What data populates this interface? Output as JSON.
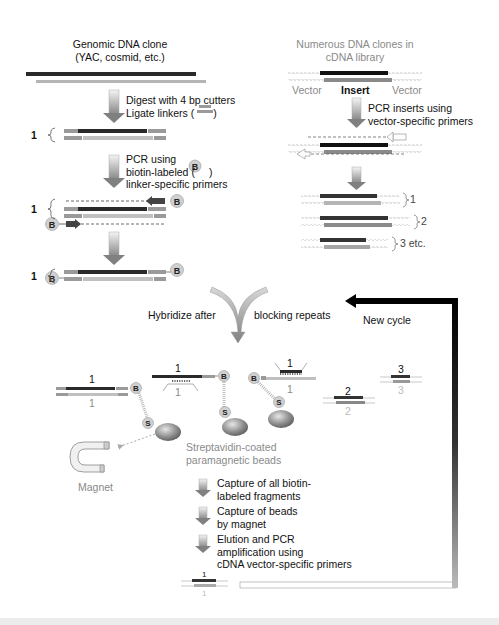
{
  "figure": {
    "left_panel": {
      "title_line1": "Genomic DNA clone",
      "title_line2": "(YAC, cosmid, etc.)",
      "step1_line1": "Digest with 4 bp cutters",
      "step1_line2": "Ligate linkers (",
      "step1_line2_end": ")",
      "step2_line1": "PCR using",
      "step2_line2": "biotin-labeled (",
      "step2_line2_end": ")",
      "step2_line3": "linker-specific primers",
      "fragment_label": "1"
    },
    "right_panel": {
      "title_line1": "Numerous DNA clones in",
      "title_line2": "cDNA library",
      "label_vector_left": "Vector",
      "label_insert": "Insert",
      "label_vector_right": "Vector",
      "step_line1": "PCR inserts using",
      "step_line2": "vector-specific primers",
      "products": [
        "1",
        "2",
        "3 etc."
      ]
    },
    "hybridize": {
      "left_text": "Hybridize after",
      "right_text": "blocking repeats"
    },
    "new_cycle_label": "New cycle",
    "hybrids": {
      "labels_top": [
        "1",
        "1",
        "1",
        "2",
        "3"
      ],
      "labels_bottom": [
        "1",
        "1",
        "1",
        "2",
        "3"
      ]
    },
    "symbols": {
      "biotin": "B",
      "streptavidin": "S"
    },
    "beads_label_line1": "Streptavidin-coated",
    "beads_label_line2": "paramagnetic beads",
    "magnet_label": "Magnet",
    "capture_steps": [
      {
        "line1": "Capture of all biotin-",
        "line2": "labeled fragments"
      },
      {
        "line1": "Capture of beads",
        "line2": "by magnet"
      },
      {
        "line1": "Elution and PCR",
        "line2": "amplification using",
        "line3": "cDNA vector-specific primers"
      }
    ],
    "final_product": {
      "top": "1",
      "bottom": "1"
    },
    "colors": {
      "dark_strand": "#2a2a2a",
      "light_strand": "#b5b5b5",
      "linker": "#9a9a9a",
      "arrow_gray": "#8c8c8c",
      "cycle_arrow": "#000000",
      "bead": "#8d8d8d"
    }
  }
}
